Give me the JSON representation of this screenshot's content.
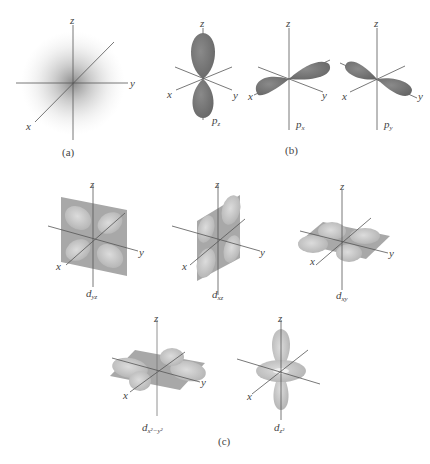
{
  "figure": {
    "panels": [
      {
        "id": "a",
        "caption": "(a)",
        "orbitals": [
          {
            "name": "s",
            "label": "",
            "axes": {
              "x": "x",
              "y": "y",
              "z": "z"
            }
          }
        ]
      },
      {
        "id": "b",
        "caption": "(b)",
        "orbitals": [
          {
            "name": "pz",
            "label_main": "p",
            "label_sub": "z",
            "axes": {
              "x": "x",
              "y": "y",
              "z": "z"
            }
          },
          {
            "name": "px",
            "label_main": "p",
            "label_sub": "x",
            "axes": {
              "x": "x",
              "y": "y",
              "z": "z"
            }
          },
          {
            "name": "py",
            "label_main": "p",
            "label_sub": "y",
            "axes": {
              "x": "x",
              "y": "y",
              "z": "z"
            }
          }
        ]
      },
      {
        "id": "c",
        "caption": "(c)",
        "orbitals": [
          {
            "name": "dyz",
            "label_main": "d",
            "label_sub": "yz",
            "axes": {
              "x": "x",
              "y": "y",
              "z": "z"
            }
          },
          {
            "name": "dxz",
            "label_main": "d",
            "label_sub": "xz",
            "axes": {
              "x": "x",
              "y": "y",
              "z": "z"
            }
          },
          {
            "name": "dxy",
            "label_main": "d",
            "label_sub": "xy",
            "axes": {
              "x": "x",
              "y": "y",
              "z": "z"
            }
          },
          {
            "name": "dx2y2",
            "label_main": "d",
            "label_sub": "x²−y²",
            "axes": {
              "x": "x",
              "y": "y",
              "z": "z"
            }
          },
          {
            "name": "dz2",
            "label_main": "d",
            "label_sub": "z²",
            "axes": {
              "x": "x",
              "y": "y",
              "z": "z"
            }
          }
        ]
      }
    ],
    "colors": {
      "p_lobe": "#777777",
      "d_lobe": "#c2c2c2",
      "d_plane": "#9a9a9a",
      "axis": "#555555",
      "s_cloud": "#888888"
    }
  }
}
